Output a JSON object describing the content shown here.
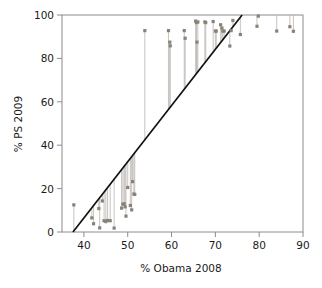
{
  "chart_data": {
    "type": "scatter",
    "title": "",
    "xlabel": "% Obama 2008",
    "ylabel": "% PS 2009",
    "xlim": [
      35,
      90
    ],
    "ylim": [
      0,
      100
    ],
    "xticks": [
      40,
      50,
      60,
      70,
      80,
      90
    ],
    "yticks": [
      0,
      20,
      40,
      60,
      80,
      100
    ],
    "grid": false,
    "legend": null,
    "marker_color": "#8a8279",
    "line_color": "#111111",
    "stem_color": "#b8b4ae",
    "axis_color": "#8c8c8c",
    "series": [
      {
        "name": "departments",
        "x": [
          37.7,
          41.8,
          42.2,
          43.4,
          43.6,
          44.2,
          44.6,
          45.0,
          45.4,
          46.0,
          46.9,
          48.6,
          48.9,
          49.2,
          49.4,
          49.6,
          50.0,
          50.6,
          50.9,
          51.1,
          51.4,
          51.6,
          53.9,
          59.3,
          59.6,
          59.7,
          62.9,
          63.1,
          65.5,
          65.7,
          65.8,
          66.0,
          67.6,
          67.8,
          69.5,
          70.0,
          70.2,
          71.2,
          71.5,
          71.7,
          72.0,
          73.3,
          73.6,
          74.0,
          75.7,
          79.5,
          79.8,
          84.0,
          87.0,
          87.8
        ],
        "y": [
          12.5,
          6.5,
          3.8,
          10.8,
          1.9,
          14.3,
          5.2,
          4.8,
          5.3,
          5.2,
          1.8,
          11.0,
          12.8,
          13.0,
          11.6,
          7.3,
          20.5,
          12.2,
          10.2,
          23.2,
          17.5,
          17.3,
          92.8,
          92.8,
          87.5,
          85.8,
          92.8,
          89.3,
          97.2,
          96.5,
          87.5,
          96.8,
          96.8,
          96.5,
          97.0,
          92.6,
          92.6,
          95.5,
          94.0,
          92.6,
          92.6,
          85.7,
          92.8,
          97.5,
          91.0,
          94.8,
          99.5,
          92.6,
          94.6,
          92.5
        ]
      }
    ],
    "fit_line": {
      "name": "regression-line",
      "x_start": 37.5,
      "y_start": 0,
      "x_end": 76.1,
      "y_end": 100
    }
  }
}
